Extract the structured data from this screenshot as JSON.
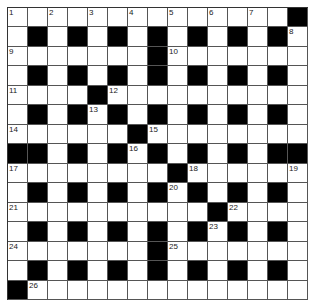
{
  "puzzle": {
    "rows": 15,
    "cols": 15,
    "colors": {
      "block": "#000000",
      "cell": "#ffffff",
      "line": "#555555"
    },
    "grid": [
      [
        "1",
        ".",
        "2",
        ".",
        "3",
        ".",
        "4",
        ".",
        "5",
        ".",
        "6",
        ".",
        "7",
        ".",
        "#"
      ],
      [
        ".",
        "#",
        ".",
        "#",
        ".",
        "#",
        ".",
        "#",
        ".",
        "#",
        ".",
        "#",
        ".",
        "#",
        "8"
      ],
      [
        "9",
        ".",
        ".",
        ".",
        ".",
        ".",
        ".",
        "#",
        "10",
        ".",
        ".",
        ".",
        ".",
        ".",
        "."
      ],
      [
        ".",
        "#",
        ".",
        "#",
        ".",
        "#",
        ".",
        "#",
        ".",
        "#",
        ".",
        "#",
        ".",
        "#",
        "."
      ],
      [
        "11",
        ".",
        ".",
        ".",
        "#",
        "12",
        ".",
        ".",
        ".",
        ".",
        ".",
        ".",
        ".",
        ".",
        "."
      ],
      [
        ".",
        "#",
        ".",
        "#",
        "13",
        "#",
        ".",
        "#",
        ".",
        "#",
        ".",
        "#",
        ".",
        "#",
        "."
      ],
      [
        "14",
        ".",
        ".",
        ".",
        ".",
        ".",
        "#",
        "15",
        ".",
        ".",
        ".",
        ".",
        ".",
        ".",
        "."
      ],
      [
        "#",
        "#",
        ".",
        "#",
        ".",
        "#",
        "16",
        "#",
        ".",
        "#",
        ".",
        "#",
        ".",
        "#",
        "#"
      ],
      [
        "17",
        ".",
        ".",
        ".",
        ".",
        ".",
        ".",
        ".",
        "#",
        "18",
        ".",
        ".",
        ".",
        ".",
        "19"
      ],
      [
        ".",
        "#",
        ".",
        "#",
        ".",
        "#",
        ".",
        "#",
        "20",
        "#",
        ".",
        "#",
        ".",
        "#",
        "."
      ],
      [
        "21",
        ".",
        ".",
        ".",
        ".",
        ".",
        ".",
        ".",
        ".",
        ".",
        "#",
        "22",
        ".",
        ".",
        "."
      ],
      [
        ".",
        "#",
        ".",
        "#",
        ".",
        "#",
        ".",
        "#",
        ".",
        "#",
        "23",
        "#",
        ".",
        "#",
        "."
      ],
      [
        "24",
        ".",
        ".",
        ".",
        ".",
        ".",
        ".",
        "#",
        "25",
        ".",
        ".",
        ".",
        ".",
        ".",
        "."
      ],
      [
        ".",
        "#",
        ".",
        "#",
        ".",
        "#",
        ".",
        "#",
        ".",
        "#",
        ".",
        "#",
        ".",
        "#",
        "."
      ],
      [
        "#",
        "26",
        ".",
        ".",
        ".",
        ".",
        ".",
        ".",
        ".",
        ".",
        ".",
        ".",
        ".",
        ".",
        "."
      ]
    ]
  }
}
